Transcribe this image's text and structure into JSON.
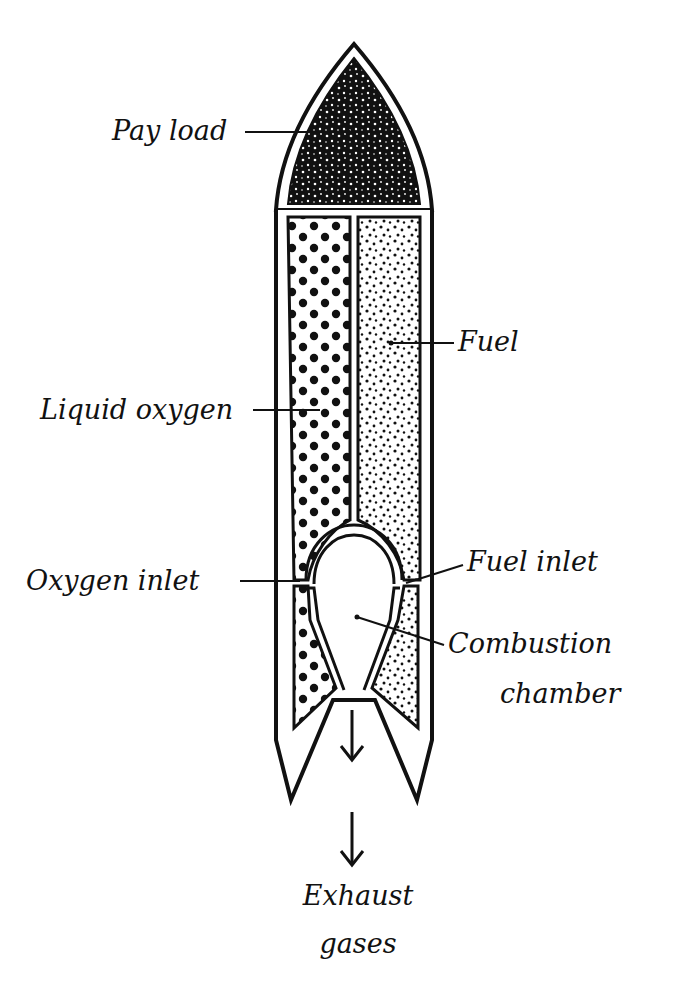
{
  "diagram": {
    "colors": {
      "ink": "#111111",
      "paper": "#ffffff"
    },
    "labels": {
      "payload": "Pay load",
      "fuel": "Fuel",
      "liquid_oxygen": "Liquid oxygen",
      "oxygen_inlet": "Oxygen inlet",
      "fuel_inlet": "Fuel inlet",
      "combustion_chamber_line1": "Combustion",
      "combustion_chamber_line2": "chamber",
      "exhaust_line1": "Exhaust",
      "exhaust_line2": "gases"
    },
    "components": [
      {
        "name": "payload",
        "fill": "dense-black-mottled"
      },
      {
        "name": "liquid-oxygen-tank",
        "fill": "large-dots"
      },
      {
        "name": "fuel-tank",
        "fill": "fine-stipple"
      },
      {
        "name": "combustion-chamber",
        "fill": "empty"
      },
      {
        "name": "exhaust-arrow",
        "direction": "down"
      }
    ]
  }
}
